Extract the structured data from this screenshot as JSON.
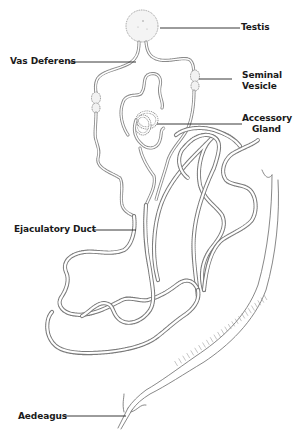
{
  "diagram": {
    "labels": {
      "testis": "Testis",
      "vas_deferens": "Vas Deferens",
      "seminal_vesicle_1": "Seminal",
      "seminal_vesicle_2": "Vesicle",
      "accessory_gland_1": "Accessory",
      "accessory_gland_2": "Gland",
      "ejaculatory_duct": "Ejaculatory Duct",
      "aedeagus": "Aedeagus"
    },
    "colors": {
      "ink": "#1a1a1a",
      "stipple": "#7a7a7a",
      "background": "#ffffff"
    }
  }
}
